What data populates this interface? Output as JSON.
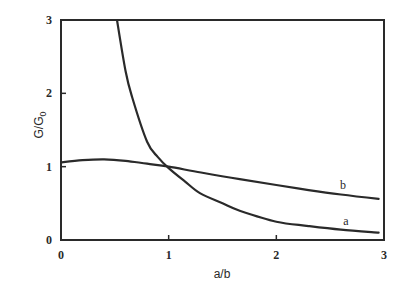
{
  "chart_data": {
    "type": "line",
    "title": "",
    "xlabel": "a/b",
    "ylabel": "G/G",
    "ylabel_subscript": "0",
    "xlim": [
      0,
      3
    ],
    "ylim": [
      0,
      3
    ],
    "xticks": [
      "0",
      "1",
      "2",
      "3"
    ],
    "yticks": [
      "0",
      "1",
      "2",
      "3"
    ],
    "grid": false,
    "legend": "inline labels near curve ends",
    "series": [
      {
        "name": "a",
        "x": [
          0.52,
          0.6,
          0.66,
          0.8,
          0.9,
          1.0,
          1.15,
          1.29,
          1.5,
          1.66,
          2.0,
          2.3,
          2.6,
          2.95
        ],
        "y": [
          3.0,
          2.3,
          1.95,
          1.34,
          1.13,
          0.98,
          0.8,
          0.64,
          0.5,
          0.4,
          0.25,
          0.19,
          0.14,
          0.1
        ]
      },
      {
        "name": "b",
        "x": [
          0.0,
          0.2,
          0.4,
          0.6,
          0.8,
          1.0,
          1.3,
          1.66,
          2.0,
          2.3,
          2.6,
          2.95
        ],
        "y": [
          1.06,
          1.09,
          1.1,
          1.08,
          1.04,
          1.0,
          0.92,
          0.83,
          0.75,
          0.68,
          0.62,
          0.56
        ]
      }
    ]
  },
  "labels": {
    "xlabel": "a/b",
    "ylabel_main": "G/G",
    "ylabel_sub": "0",
    "curve_a": "a",
    "curve_b": "b"
  }
}
